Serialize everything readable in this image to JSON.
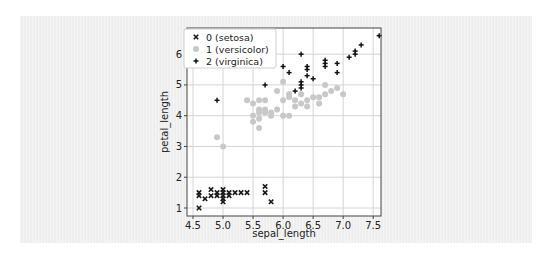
{
  "chart_data": {
    "type": "scatter",
    "title": "",
    "xlabel": "sepal_length",
    "ylabel": "petal_length",
    "xlim": [
      4.4,
      7.63
    ],
    "ylim": [
      0.74,
      6.85
    ],
    "xticks": [
      4.5,
      5.0,
      5.5,
      6.0,
      6.5,
      7.0,
      7.5
    ],
    "xtick_labels": [
      "4.5",
      "5.0",
      "5.5",
      "6.0",
      "6.5",
      "7.0",
      "7.5"
    ],
    "yticks": [
      1,
      2,
      3,
      4,
      5,
      6
    ],
    "ytick_labels": [
      "1",
      "2",
      "3",
      "4",
      "5",
      "6"
    ],
    "grid": true,
    "legend_position": "upper left",
    "series": [
      {
        "name": "0 (setosa)",
        "marker": "x",
        "color": "#1a1a1a",
        "points": [
          [
            4.6,
            1.0
          ],
          [
            4.6,
            1.4
          ],
          [
            4.6,
            1.5
          ],
          [
            4.7,
            1.3
          ],
          [
            4.8,
            1.6
          ],
          [
            4.8,
            1.4
          ],
          [
            4.9,
            1.4
          ],
          [
            4.9,
            1.5
          ],
          [
            5.0,
            1.2
          ],
          [
            5.0,
            1.3
          ],
          [
            5.0,
            1.4
          ],
          [
            5.0,
            1.5
          ],
          [
            5.0,
            1.6
          ],
          [
            5.1,
            1.4
          ],
          [
            5.1,
            1.5
          ],
          [
            5.2,
            1.5
          ],
          [
            5.3,
            1.5
          ],
          [
            5.4,
            1.5
          ],
          [
            5.7,
            1.5
          ],
          [
            5.7,
            1.7
          ],
          [
            5.8,
            1.2
          ]
        ]
      },
      {
        "name": "1 (versicolor)",
        "marker": "o",
        "color": "#c8c8c8",
        "points": [
          [
            4.9,
            3.3
          ],
          [
            5.0,
            3.0
          ],
          [
            5.4,
            4.5
          ],
          [
            5.5,
            3.8
          ],
          [
            5.5,
            4.0
          ],
          [
            5.5,
            4.4
          ],
          [
            5.6,
            3.6
          ],
          [
            5.6,
            3.9
          ],
          [
            5.6,
            4.1
          ],
          [
            5.6,
            4.2
          ],
          [
            5.6,
            4.5
          ],
          [
            5.7,
            4.1
          ],
          [
            5.7,
            4.2
          ],
          [
            5.7,
            4.5
          ],
          [
            5.8,
            4.0
          ],
          [
            5.8,
            4.1
          ],
          [
            5.9,
            4.2
          ],
          [
            5.9,
            4.8
          ],
          [
            6.0,
            4.5
          ],
          [
            6.0,
            5.1
          ],
          [
            6.0,
            4.0
          ],
          [
            6.1,
            4.7
          ],
          [
            6.1,
            4.0
          ],
          [
            6.1,
            4.6
          ],
          [
            6.2,
            4.3
          ],
          [
            6.2,
            4.5
          ],
          [
            6.3,
            4.7
          ],
          [
            6.3,
            4.4
          ],
          [
            6.4,
            4.3
          ],
          [
            6.4,
            4.5
          ],
          [
            6.5,
            4.6
          ],
          [
            6.6,
            4.4
          ],
          [
            6.6,
            4.6
          ],
          [
            6.7,
            4.7
          ],
          [
            6.7,
            5.0
          ],
          [
            6.8,
            4.8
          ],
          [
            6.9,
            4.9
          ],
          [
            7.0,
            4.7
          ]
        ]
      },
      {
        "name": "2 (virginica)",
        "marker": "+",
        "color": "#111111",
        "points": [
          [
            4.9,
            4.5
          ],
          [
            5.7,
            5.0
          ],
          [
            6.0,
            5.6
          ],
          [
            6.1,
            5.4
          ],
          [
            6.2,
            4.8
          ],
          [
            6.3,
            4.9
          ],
          [
            6.3,
            5.0
          ],
          [
            6.3,
            5.1
          ],
          [
            6.3,
            6.0
          ],
          [
            6.4,
            5.3
          ],
          [
            6.4,
            5.5
          ],
          [
            6.4,
            5.6
          ],
          [
            6.5,
            5.2
          ],
          [
            6.7,
            5.6
          ],
          [
            6.7,
            5.7
          ],
          [
            6.7,
            5.8
          ],
          [
            6.9,
            5.4
          ],
          [
            6.9,
            5.7
          ],
          [
            7.1,
            5.9
          ],
          [
            7.2,
            6.0
          ],
          [
            7.2,
            6.1
          ],
          [
            7.3,
            6.3
          ],
          [
            7.6,
            6.6
          ]
        ]
      }
    ]
  }
}
